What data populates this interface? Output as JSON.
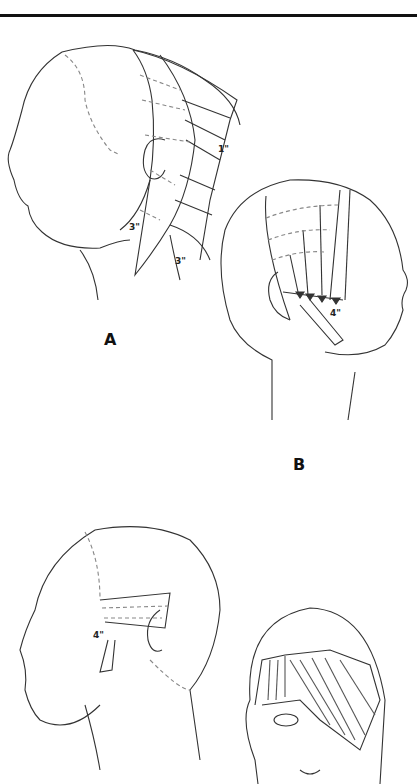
{
  "figure": {
    "panels": [
      {
        "label": "A",
        "measurements": [
          "1\"",
          "3\"",
          "3\""
        ],
        "description": "Left profile head with back/nape sections and elevated guide strands"
      },
      {
        "label": "B",
        "measurements": [
          "4\""
        ],
        "description": "Right profile head with side section combed down with arrows"
      },
      {
        "label": "C",
        "measurements": [
          "4\""
        ],
        "description": "Left profile head with side sectioning and 4-inch guide"
      },
      {
        "label": "D",
        "measurements": [],
        "description": "Front view head with fringe section combed diagonally with arrows"
      }
    ]
  },
  "colors": {
    "line": "#333333",
    "dash": "#777777",
    "background": "#ffffff"
  }
}
